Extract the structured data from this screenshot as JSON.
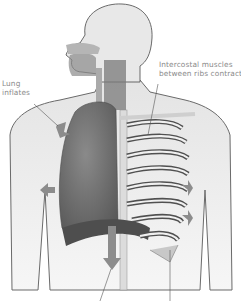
{
  "labels": {
    "lung": {
      "line1": "Lung",
      "line2": "inflates"
    },
    "intercostal": {
      "line1": "Intercostal muscles",
      "line2": "between ribs contract"
    }
  },
  "arrows": [
    {
      "name": "lung-expand-arrow-upper",
      "direction": "down-right"
    },
    {
      "name": "lung-expand-arrow-left",
      "direction": "left"
    },
    {
      "name": "diaphragm-arrow",
      "direction": "down"
    },
    {
      "name": "ribcage-arrow-right-upper",
      "direction": "right"
    },
    {
      "name": "ribcage-arrow-right-lower",
      "direction": "right"
    }
  ],
  "colors": {
    "background": "#ffffff",
    "body_outline": "#555555",
    "lung": "#6e6e6e",
    "arrow": "#8c8c8c",
    "label_text": "#8a8a8a"
  }
}
